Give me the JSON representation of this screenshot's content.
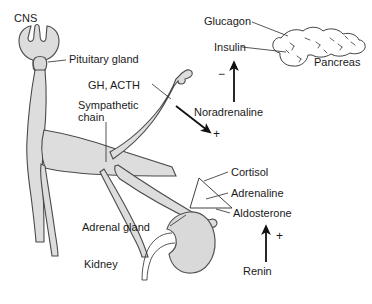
{
  "figure": {
    "background_color": "#ffffff",
    "organ_fill_color": "#dddddd",
    "outline_color": "#3a3a3a",
    "text_color": "#1a1a1a"
  },
  "labels": {
    "cns": "CNS",
    "pituitary_gland": "Pituitary gland",
    "gh_acth": "GH, ACTH",
    "sympathetic_chain_line1": "Sympathetic",
    "sympathetic_chain_line2": "chain",
    "adrenal_gland": "Adrenal gland",
    "kidney": "Kidney",
    "glucagon": "Glucagon",
    "insulin": "Insulin",
    "pancreas": "Pancreas",
    "noradrenaline": "Noradrenaline",
    "cortisol": "Cortisol",
    "adrenaline": "Adrenaline",
    "aldosterone": "Aldosterone",
    "renin": "Renin"
  },
  "signs": {
    "noradrenaline_sign": "−",
    "sympathetic_to_pancreas_sign": "+",
    "renin_sign": "+"
  },
  "arrows": [
    {
      "name": "noradrenaline-arrow",
      "direction": "up",
      "source_label": "Noradrenaline",
      "target_label": "Pancreas",
      "sign": "−"
    },
    {
      "name": "sympathetic-to-adrenal-arrow",
      "direction": "down-right",
      "sign": "+"
    },
    {
      "name": "renin-arrow",
      "direction": "up",
      "source_label": "Renin",
      "target_label": "Aldosterone",
      "sign": "+"
    }
  ]
}
